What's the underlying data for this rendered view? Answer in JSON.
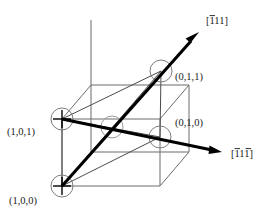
{
  "figure": {
    "kind": "crystallographic-direction-diagram",
    "background_color": "#ffffff",
    "line_color": "#6b6b6b",
    "vector_color": "#000000",
    "width": 269,
    "height": 219
  },
  "direction_vectors": [
    {
      "id": "vector-111-bar-first",
      "label": "[111]",
      "label_digits": [
        {
          "text": "1",
          "overbar": true
        },
        {
          "text": "1",
          "overbar": false
        },
        {
          "text": "1",
          "overbar": false
        }
      ],
      "label_x": 206,
      "label_y": 22,
      "start_x": 62,
      "start_y": 186,
      "end_x": 199,
      "end_y": 33
    },
    {
      "id": "vector-111-bar-first-third",
      "label": "[111]",
      "label_digits": [
        {
          "text": "1",
          "overbar": true
        },
        {
          "text": "1",
          "overbar": false
        },
        {
          "text": "1",
          "overbar": true
        }
      ],
      "label_x": 231,
      "label_y": 155,
      "start_x": 62,
      "start_y": 119,
      "end_x": 222,
      "end_y": 152
    }
  ],
  "lattice_sites": [
    {
      "id": "site-101",
      "label": "(1,0,1)",
      "cx": 62,
      "cy": 119,
      "r": 11,
      "label_x": 7,
      "label_y": 133,
      "cross": true,
      "faint": false
    },
    {
      "id": "site-100",
      "label": "(1,0,0)",
      "cx": 62,
      "cy": 186,
      "r": 11,
      "label_x": 9,
      "label_y": 202,
      "cross": true,
      "faint": false
    },
    {
      "id": "site-011",
      "label": "(0,1,1)",
      "cx": 161,
      "cy": 71,
      "r": 11,
      "label_x": 175,
      "label_y": 78,
      "cross": false,
      "faint": false
    },
    {
      "id": "site-010",
      "label": "(0,1,0)",
      "cx": 160,
      "cy": 137,
      "r": 11,
      "label_x": 175,
      "label_y": 124,
      "cross": false,
      "faint": false
    },
    {
      "id": "site-center",
      "label": "",
      "cx": 112,
      "cy": 127,
      "r": 11,
      "label_x": 0,
      "label_y": 0,
      "cross": false,
      "faint": true
    }
  ],
  "cube": {
    "front_bottom_left": {
      "x": 62,
      "y": 119
    },
    "front_bottom_right": {
      "x": 160,
      "y": 119
    },
    "front_top_left": {
      "x": 62,
      "y": 52
    },
    "front_top_right": {
      "x": 160,
      "y": 52
    },
    "back_bottom_left": {
      "x": 91,
      "y": 152
    },
    "back_bottom_right": {
      "x": 189,
      "y": 152
    },
    "back_top_left": {
      "x": 91,
      "y": 85
    },
    "back_top_right": {
      "x": 189,
      "y": 85
    }
  },
  "plane_triangle": {
    "vertices": [
      {
        "x": 62,
        "y": 119
      },
      {
        "x": 161,
        "y": 71
      },
      {
        "x": 62,
        "y": 186
      },
      {
        "x": 160,
        "y": 137
      }
    ]
  }
}
